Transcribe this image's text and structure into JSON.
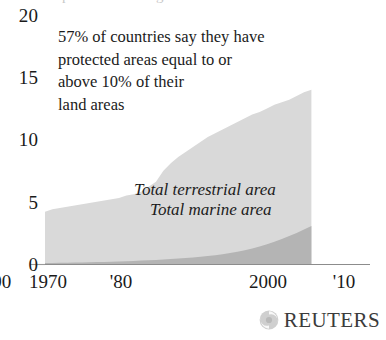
{
  "chart_data": {
    "type": "area",
    "title": "",
    "clipped_title": "protected areas growth",
    "xlabel": "",
    "ylabel": "",
    "xlim": [
      1970,
      2010
    ],
    "ylim": [
      0,
      20
    ],
    "grid": false,
    "stacked": false,
    "legend_position": "inside-center",
    "x_tick_labels": [
      "1970",
      "'80",
      "'90",
      "2000",
      "'10"
    ],
    "x_tick_values": [
      1970,
      1980,
      1990,
      2000,
      2010
    ],
    "y_tick_labels": [
      "20",
      "15",
      "10",
      "5",
      "0"
    ],
    "y_tick_values": [
      20,
      15,
      10,
      5,
      0
    ],
    "x": [
      1970,
      1971,
      1972,
      1973,
      1974,
      1975,
      1976,
      1977,
      1978,
      1979,
      1980,
      1981,
      1982,
      1983,
      1984,
      1985,
      1986,
      1987,
      1988,
      1989,
      1990,
      1991,
      1992,
      1993,
      1994,
      1995,
      1996,
      1997,
      1998,
      1999,
      2000,
      2001,
      2002,
      2003,
      2004,
      2005,
      2006
    ],
    "series": [
      {
        "name": "Total terrestrial area",
        "color": "#d9d9d9",
        "values": [
          4.2,
          4.4,
          4.5,
          4.6,
          4.7,
          4.8,
          4.9,
          5.0,
          5.1,
          5.2,
          5.3,
          5.5,
          5.6,
          5.8,
          6.2,
          6.6,
          7.5,
          8.1,
          8.6,
          9.0,
          9.4,
          9.8,
          10.2,
          10.5,
          10.8,
          11.1,
          11.4,
          11.7,
          12.0,
          12.2,
          12.5,
          12.8,
          13.0,
          13.2,
          13.5,
          13.8,
          14.0
        ]
      },
      {
        "name": "Total marine area",
        "color": "#b4b4b4",
        "values": [
          0.08,
          0.09,
          0.1,
          0.11,
          0.12,
          0.13,
          0.14,
          0.16,
          0.17,
          0.19,
          0.21,
          0.23,
          0.25,
          0.28,
          0.3,
          0.33,
          0.36,
          0.4,
          0.44,
          0.48,
          0.53,
          0.58,
          0.64,
          0.71,
          0.79,
          0.88,
          0.98,
          1.1,
          1.24,
          1.4,
          1.58,
          1.78,
          2.0,
          2.24,
          2.5,
          2.78,
          3.05
        ]
      }
    ],
    "annotation": {
      "lines": [
        "57% of countries say they have",
        "protected areas equal to or",
        "above 10% of their",
        "land areas"
      ]
    }
  },
  "credit": {
    "wordmark": "REUTERS",
    "mark_name": "reuters-swirl-logo"
  },
  "colors": {
    "terrestrial": "#d9d9d9",
    "marine": "#b4b4b4",
    "axis_line": "#8c8c8c",
    "text": "#1a1a1a"
  }
}
